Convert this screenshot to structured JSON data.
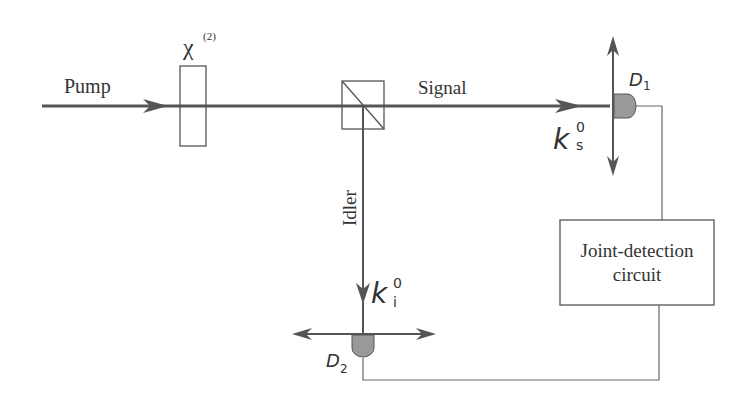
{
  "diagram": {
    "pump_label": "Pump",
    "crystal_label": "χ",
    "crystal_superscript": "(2)",
    "signal_label": "Signal",
    "idler_label": "Idler",
    "ks_label": "k",
    "ks_sub": "s",
    "ks_sup": "0",
    "ki_label": "k",
    "ki_sub": "i",
    "ki_sup": "0",
    "d1_label": "D",
    "d1_sub": "1",
    "d2_label": "D",
    "d2_sub": "2",
    "circuit_line1": "Joint-detection",
    "circuit_line2": "circuit",
    "colors": {
      "beam": "#555555",
      "line": "#666666",
      "detector": "#888888",
      "text": "#333333"
    }
  }
}
